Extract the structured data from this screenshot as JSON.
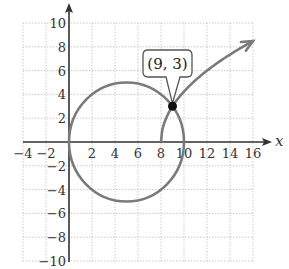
{
  "chart_data": {
    "type": "line",
    "title": "",
    "xlabel": "x",
    "ylabel": "y",
    "xlim": [
      -4,
      16
    ],
    "ylim": [
      -10,
      10
    ],
    "grid": true,
    "grid_step": 2,
    "x_ticks": [
      "−4",
      "−2",
      "2",
      "4",
      "6",
      "8",
      "10",
      "12",
      "14",
      "16"
    ],
    "x_tick_values": [
      -4,
      -2,
      2,
      4,
      6,
      8,
      10,
      12,
      14,
      16
    ],
    "y_ticks": [
      "10",
      "8",
      "6",
      "4",
      "2",
      "−2",
      "−4",
      "−6",
      "−8",
      "−10"
    ],
    "y_tick_values": [
      10,
      8,
      6,
      4,
      2,
      -2,
      -4,
      -6,
      -8,
      -10
    ],
    "series": [
      {
        "name": "circle",
        "kind": "circle",
        "description": "(x − 5)^2 + y^2 = 25",
        "center": [
          5,
          0
        ],
        "radius": 5,
        "color": "#7a7a7a"
      },
      {
        "name": "radical curve",
        "kind": "function",
        "description": "y = 3√(x − 8)",
        "domain": [
          8,
          16
        ],
        "points": [
          [
            8,
            0
          ],
          [
            8.25,
            1.5
          ],
          [
            9,
            3
          ],
          [
            10,
            4.24
          ],
          [
            12,
            6
          ],
          [
            14,
            7.35
          ],
          [
            16,
            8.49
          ]
        ],
        "arrow_at_end": true,
        "color": "#7a7a7a"
      }
    ],
    "annotations": [
      {
        "label": "(9, 3)",
        "point": [
          9,
          3
        ],
        "marker": "filled-circle"
      }
    ]
  },
  "labels": {
    "x_axis": "x",
    "point_label": "(9, 3)"
  }
}
